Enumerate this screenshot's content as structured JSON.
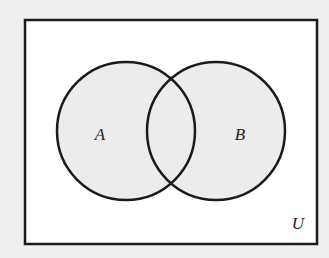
{
  "diagram": {
    "type": "venn",
    "universe": {
      "label": "U",
      "rect": {
        "x": 25,
        "y": 20,
        "width": 292,
        "height": 224
      },
      "fill": "#ffffff",
      "stroke": "#1a1a1a"
    },
    "sets": [
      {
        "label": "A",
        "cx": 126,
        "cy": 131,
        "r": 69,
        "label_x": 100,
        "label_y": 140
      },
      {
        "label": "B",
        "cx": 216,
        "cy": 131,
        "r": 69,
        "label_x": 240,
        "label_y": 140
      }
    ],
    "set_fill": "#ececec",
    "set_stroke": "#1a1a1a",
    "universe_label_pos": {
      "x": 298,
      "y": 229
    },
    "background": "#efefef"
  }
}
